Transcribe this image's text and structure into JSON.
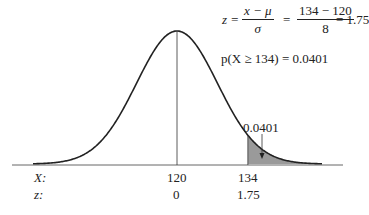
{
  "formula": {
    "lhs": "z =",
    "frac1_num": "x − μ",
    "frac1_den": "σ",
    "eq1": "=",
    "frac2_num": "134 − 120",
    "frac2_den": "8",
    "eq2": "= 1.75"
  },
  "probability": "p(X ≥ 134) = 0.0401",
  "area_label": "0.0401",
  "axis": {
    "x_row_label": "X:",
    "z_row_label": "z:",
    "x_ticks": [
      "120",
      "134"
    ],
    "z_ticks": [
      "0",
      "1.75"
    ]
  },
  "chart_data": {
    "type": "area",
    "mean": 120,
    "sd": 8,
    "shaded_from": 134,
    "shaded_area": 0.0401,
    "x_ticks": [
      120,
      134
    ],
    "z_ticks": [
      0,
      1.75
    ],
    "annotations": [
      "z = (x − μ)/σ = (134 − 120)/8 = 1.75",
      "p(X ≥ 134) = 0.0401",
      "0.0401"
    ]
  },
  "colors": {
    "line": "#222222",
    "shade": "#9a9a9a",
    "axis": "#555555"
  }
}
